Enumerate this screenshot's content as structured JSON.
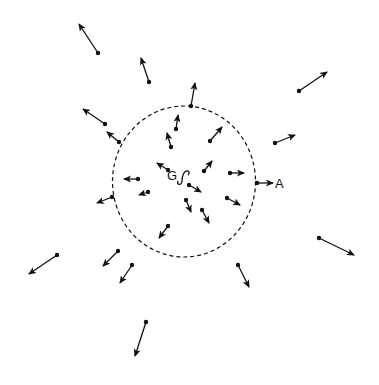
{
  "diagram": {
    "colors": {
      "ink": "#111111",
      "background": "#ffffff"
    },
    "labels": {
      "center": "G",
      "boundary_point": "A"
    },
    "boundary": {
      "style": "dashed",
      "shape": "circle"
    },
    "arrows_inside": [
      {
        "from": [
          176,
          129
        ],
        "to": [
          178,
          115
        ]
      },
      {
        "from": [
          171,
          147
        ],
        "to": [
          167,
          133
        ]
      },
      {
        "from": [
          210,
          141
        ],
        "to": [
          222,
          127
        ]
      },
      {
        "from": [
          168,
          170
        ],
        "to": [
          157,
          163
        ]
      },
      {
        "from": [
          204,
          171
        ],
        "to": [
          212,
          161
        ]
      },
      {
        "from": [
          230,
          173
        ],
        "to": [
          244,
          173
        ]
      },
      {
        "from": [
          138,
          179
        ],
        "to": [
          124,
          179
        ]
      },
      {
        "from": [
          148,
          192
        ],
        "to": [
          139,
          195
        ]
      },
      {
        "from": [
          189,
          185
        ],
        "to": [
          201,
          192
        ]
      },
      {
        "from": [
          186,
          200
        ],
        "to": [
          191,
          212
        ]
      },
      {
        "from": [
          202,
          210
        ],
        "to": [
          209,
          223
        ]
      },
      {
        "from": [
          227,
          198
        ],
        "to": [
          240,
          205
        ]
      },
      {
        "from": [
          168,
          226
        ],
        "to": [
          159,
          238
        ]
      }
    ],
    "arrows_outside": [
      {
        "from": [
          98,
          53
        ],
        "to": [
          79,
          24
        ]
      },
      {
        "from": [
          149,
          82
        ],
        "to": [
          141,
          58
        ]
      },
      {
        "from": [
          191,
          106
        ],
        "to": [
          195,
          83
        ]
      },
      {
        "from": [
          299,
          91
        ],
        "to": [
          327,
          72
        ]
      },
      {
        "from": [
          105,
          124
        ],
        "to": [
          83,
          109
        ]
      },
      {
        "from": [
          119,
          142
        ],
        "to": [
          107,
          132
        ]
      },
      {
        "from": [
          275,
          143
        ],
        "to": [
          295,
          135
        ]
      },
      {
        "from": [
          257,
          183
        ],
        "to": [
          273,
          183
        ],
        "label": "A"
      },
      {
        "from": [
          112,
          197
        ],
        "to": [
          97,
          203
        ]
      },
      {
        "from": [
          57,
          255
        ],
        "to": [
          29,
          274
        ]
      },
      {
        "from": [
          118,
          251
        ],
        "to": [
          103,
          266
        ]
      },
      {
        "from": [
          132,
          265
        ],
        "to": [
          120,
          283
        ]
      },
      {
        "from": [
          238,
          265
        ],
        "to": [
          249,
          287
        ]
      },
      {
        "from": [
          319,
          238
        ],
        "to": [
          354,
          255
        ]
      },
      {
        "from": [
          146,
          322
        ],
        "to": [
          135,
          356
        ]
      }
    ]
  }
}
